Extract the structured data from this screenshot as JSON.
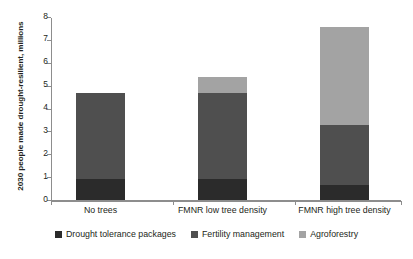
{
  "chart_data": {
    "type": "bar",
    "subtype": "stacked-bar",
    "title": "",
    "xlabel": "",
    "ylabel": "2030 people made drought-resilient, millions",
    "ylim": [
      0,
      8
    ],
    "ytick_labels": [
      "0",
      "1",
      "2",
      "3",
      "4",
      "5",
      "6",
      "7",
      "8"
    ],
    "yticks": [
      0,
      1,
      2,
      3,
      4,
      5,
      6,
      7,
      8
    ],
    "grid": false,
    "legend_position": "bottom",
    "categories": [
      "No trees",
      "FMNR low tree density",
      "FMNR high tree density"
    ],
    "series": [
      {
        "name": "Drought tolerance packages",
        "color": "#2b2b2b",
        "values": [
          0.9,
          0.9,
          0.65
        ]
      },
      {
        "name": "Fertility management",
        "color": "#4f4f4f",
        "values": [
          3.8,
          3.8,
          2.65
        ]
      },
      {
        "name": "Agroforestry",
        "color": "#a3a3a3",
        "values": [
          0,
          0.7,
          4.25
        ]
      }
    ],
    "totals": [
      4.7,
      5.4,
      7.55
    ]
  },
  "axis": {
    "y_title": "2030 people made drought-resilient, millions",
    "tick_0": "0",
    "tick_1": "1",
    "tick_2": "2",
    "tick_3": "3",
    "tick_4": "4",
    "tick_5": "5",
    "tick_6": "6",
    "tick_7": "7",
    "tick_8": "8"
  },
  "categories": {
    "cat_0": "No trees",
    "cat_1": "FMNR low tree density",
    "cat_2": "FMNR high tree density"
  },
  "legend": {
    "item_0": "Drought tolerance packages",
    "item_1": "Fertility management",
    "item_2": "Agroforestry"
  },
  "colors": {
    "drought_tolerance": "#2b2b2b",
    "fertility_management": "#4f4f4f",
    "agroforestry": "#a3a3a3",
    "axis": "#8d8d8d",
    "text": "#231f20",
    "background": "#ffffff"
  }
}
